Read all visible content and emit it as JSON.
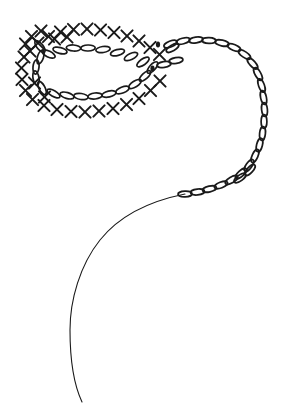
{
  "canvas": {
    "width": 299,
    "height": 412,
    "background_color": "#ffffff",
    "ink_color": "#1a1a1a",
    "title": "Crochet Chart Diagram"
  },
  "diagram": {
    "name": "crochet-oval-foundation-chart",
    "symbol_legend": [
      {
        "key": "chain",
        "glyph": "oval",
        "label": "chain stitch"
      },
      {
        "key": "single_crochet",
        "glyph": "x",
        "label": "single crochet"
      },
      {
        "key": "slip_stitch",
        "glyph": "dot",
        "label": "slip stitch"
      }
    ],
    "stroke_width_chain": 1.7,
    "stroke_width_x": 2.0,
    "stroke_width_tail": 1.1,
    "counts": {
      "foundation_chain_ovals": 22,
      "single_crochet_x_symbols": 34,
      "trailing_chain_ovals": 28,
      "slip_stitch_dots": 2
    }
  },
  "chart_data": {
    "type": "scatter",
    "title": "Crochet Chart Diagram",
    "xlabel": "",
    "ylabel": "",
    "xlim": [
      0,
      299
    ],
    "ylim": [
      0,
      412
    ],
    "grid": false,
    "legend": "none",
    "series": [
      {
        "name": "foundation-oval-chain",
        "symbol": "oval",
        "points": [
          [
            40.5,
            57.0,
            108
          ],
          [
            36.0,
            67.0,
            96
          ],
          [
            36.0,
            78.0,
            80
          ],
          [
            42.0,
            88.0,
            62
          ],
          [
            53.5,
            93.5,
            30
          ],
          [
            67.0,
            95.5,
            16
          ],
          [
            81.0,
            96.5,
            8
          ],
          [
            95.0,
            96.0,
            354
          ],
          [
            109.0,
            94.0,
            347
          ],
          [
            122.5,
            90.0,
            338
          ],
          [
            135.0,
            84.0,
            328
          ],
          [
            145.0,
            76.0,
            318
          ],
          [
            152.5,
            67.5,
            312
          ],
          [
            143.0,
            62.0,
            145
          ],
          [
            131.0,
            56.5,
            155
          ],
          [
            117.5,
            52.5,
            165
          ],
          [
            103.0,
            49.5,
            172
          ],
          [
            88.0,
            48.0,
            178
          ],
          [
            73.5,
            48.0,
            184
          ],
          [
            60.0,
            50.5,
            194
          ],
          [
            48.5,
            54.0,
            206
          ],
          [
            40.0,
            46.5,
            230
          ]
        ]
      },
      {
        "name": "outer-single-crochet-ring",
        "symbol": "x",
        "points": [
          [
            24.0,
            57.0,
            0
          ],
          [
            21.5,
            68.0,
            0
          ],
          [
            22.0,
            79.5,
            0
          ],
          [
            25.5,
            90.5,
            0
          ],
          [
            32.5,
            99.5,
            0
          ],
          [
            44.0,
            105.5,
            0
          ],
          [
            57.0,
            109.5,
            0
          ],
          [
            71.0,
            111.5,
            0
          ],
          [
            85.0,
            112.0,
            0
          ],
          [
            99.0,
            111.0,
            0
          ],
          [
            113.0,
            108.5,
            0
          ],
          [
            126.5,
            104.5,
            0
          ],
          [
            139.0,
            98.5,
            0
          ],
          [
            150.5,
            90.5,
            0
          ],
          [
            160.0,
            81.0,
            0
          ],
          [
            159.5,
            54.5,
            0
          ],
          [
            150.0,
            47.5,
            0
          ],
          [
            139.0,
            41.0,
            0
          ],
          [
            127.0,
            36.0,
            0
          ],
          [
            114.0,
            32.5,
            0
          ],
          [
            100.5,
            30.0,
            0
          ],
          [
            87.0,
            29.0,
            0
          ],
          [
            73.5,
            29.5,
            0
          ],
          [
            60.5,
            32.0,
            0
          ],
          [
            48.5,
            36.5,
            0
          ],
          [
            38.0,
            43.0,
            0
          ],
          [
            30.0,
            51.0,
            0
          ],
          [
            25.5,
            44.0,
            0
          ],
          [
            31.5,
            36.5,
            0
          ],
          [
            41.0,
            31.0,
            0
          ],
          [
            54.5,
            39.0,
            0
          ],
          [
            67.0,
            37.0,
            0
          ],
          [
            44.5,
            97.0,
            0
          ],
          [
            34.5,
            83.0,
            0
          ]
        ]
      },
      {
        "name": "slip-stitch-markers",
        "symbol": "dot",
        "points": [
          [
            158.0,
            44.5,
            0
          ],
          [
            152.5,
            68.5,
            0
          ]
        ]
      },
      {
        "name": "trailing-chain",
        "symbol": "oval",
        "points": [
          [
            170.5,
            44.0,
            338
          ],
          [
            183.0,
            41.0,
            345
          ],
          [
            196.0,
            40.0,
            352
          ],
          [
            209.0,
            40.5,
            2
          ],
          [
            222.0,
            43.0,
            12
          ],
          [
            234.0,
            47.5,
            22
          ],
          [
            244.5,
            54.5,
            34
          ],
          [
            252.5,
            63.5,
            48
          ],
          [
            258.0,
            74.0,
            60
          ],
          [
            261.5,
            85.5,
            70
          ],
          [
            263.5,
            97.5,
            78
          ],
          [
            264.5,
            109.5,
            84
          ],
          [
            264.0,
            121.5,
            90
          ],
          [
            262.5,
            133.5,
            96
          ],
          [
            259.5,
            145.0,
            104
          ],
          [
            255.0,
            156.0,
            114
          ],
          [
            249.0,
            165.5,
            126
          ],
          [
            241.0,
            173.5,
            138
          ],
          [
            231.5,
            180.0,
            150
          ],
          [
            221.0,
            185.0,
            160
          ],
          [
            209.5,
            189.0,
            168
          ],
          [
            197.5,
            192.0,
            174
          ],
          [
            185.0,
            194.0,
            178
          ],
          [
            172.5,
            48.0,
            330
          ],
          [
            164.0,
            64.5,
            350
          ],
          [
            176.0,
            60.5,
            350
          ],
          [
            250.0,
            170.0,
            132
          ],
          [
            240.0,
            178.0,
            144
          ]
        ]
      }
    ],
    "paths": [
      {
        "name": "yarn-tail",
        "kind": "thin-curve",
        "d": "M 185,194 C 150,201 120,215 100,240 C 80,265 70,300 70,330 C 70,360 74,385 82,402"
      }
    ]
  }
}
